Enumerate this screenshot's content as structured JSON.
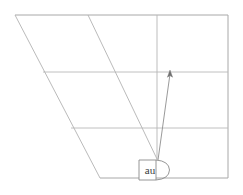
{
  "figure": {
    "title": "au",
    "background_color": "#ffffff",
    "width": 243,
    "height": 195
  },
  "node": {
    "label": "au",
    "shape": "rounded-right-box",
    "x": 139,
    "y": 160,
    "width": 24,
    "height": 20,
    "stroke_color": "#8a8a8a",
    "fill_color": "#ffffff"
  },
  "arrow": {
    "label": "",
    "from_x": 158,
    "from_y": 160,
    "to_x": 170,
    "to_y": 71,
    "color": "#8e8e8e",
    "head": "open-arrowhead"
  },
  "vertical": {
    "label": "",
    "x": 157,
    "top_y": 15,
    "bottom_y": 160,
    "color": "#b5b5b5"
  },
  "grid": {
    "horizontal_lines": [
      {
        "name": "top-border",
        "y": 15,
        "x1": 15,
        "x2": 228,
        "color": "#a8a8a8"
      },
      {
        "name": "grid-line-1",
        "y": 72,
        "x1": 43,
        "x2": 228,
        "color": "#b9b9b9"
      },
      {
        "name": "grid-line-2",
        "y": 128,
        "x1": 71,
        "x2": 228,
        "color": "#b9b9b9"
      },
      {
        "name": "bottom-border",
        "y": 178,
        "x1": 100,
        "x2": 228,
        "color": "#a8a8a8"
      }
    ],
    "vertical_borders": [
      {
        "name": "right-border",
        "x": 228,
        "y1": 15,
        "y2": 178,
        "color": "#a8a8a8"
      }
    ],
    "diagonals": [
      {
        "name": "left-diagonal",
        "x1": 15,
        "y1": 15,
        "x2": 100,
        "y2": 178,
        "color": "#b2b2b2"
      },
      {
        "name": "inner-diagonal",
        "x1": 88,
        "y1": 15,
        "x2": 157,
        "y2": 159,
        "color": "#b2b2b2"
      }
    ]
  },
  "colors": {
    "line": "#b9b9b9",
    "border": "#a8a8a8",
    "accent": "#8e8e8e",
    "text": "#3a3a3a",
    "background": "#ffffff"
  }
}
